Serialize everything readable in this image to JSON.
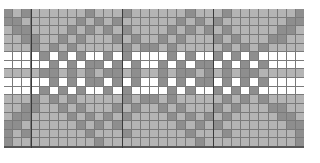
{
  "pattern": {
    "columns": 33,
    "rows": 16,
    "legend": {
      "0": "light gray",
      "1": "dark gray",
      "2": "white"
    },
    "colors": {
      "light": "#b4b4b4",
      "dark": "#8e8e8e",
      "white": "#ffffff",
      "gridline": "#7a7a7a",
      "major_gridline": "#3a3a3a"
    },
    "major_line_every": 10,
    "major_line_columns": [
      3,
      13,
      23
    ],
    "grid": [
      "101000000100010000001000100000001",
      "110000001010100000010101000000011",
      "011000010101010000101010100000110",
      "001100101000101001010001010001100",
      "000101010000010110100000101010000",
      "222212121221212222121221212122222",
      "222221212112121221212112121212222",
      "000011010101101001011010101100000",
      "222221212112121221212112121212222",
      "222212121221212222121221212122222",
      "000101010000010110100000101010000",
      "001100101000101001010001010001100",
      "011000010101010000101010100000110",
      "110000001010100000010101000000011",
      "101000000100010000001000100000001",
      "100000000010000000000100000000001"
    ]
  }
}
